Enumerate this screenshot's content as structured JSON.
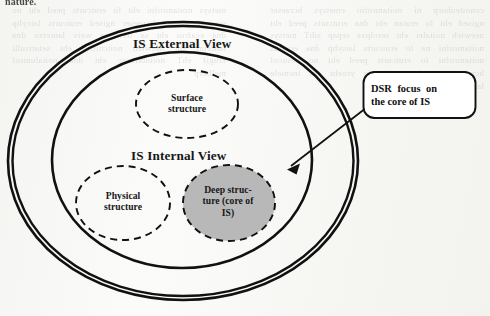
{
  "page": {
    "width": 490,
    "height": 316,
    "background_color": "#f6f6f3",
    "top_text_fragment": "nature."
  },
  "diagram": {
    "type": "nested-ellipse-venn",
    "title_visible": false,
    "outer_region": {
      "name": "IS External View",
      "label": "IS External View",
      "border_style": "double-solid",
      "border_color": "#111111",
      "fill": "none"
    },
    "inner_region": {
      "name": "IS Internal View",
      "label": "IS Internal View",
      "border_style": "solid",
      "border_color": "#111111",
      "fill": "none"
    },
    "nodes": [
      {
        "id": "surface",
        "label": "Surface structure",
        "lines": [
          "Surface",
          "structure"
        ],
        "shape": "ellipse",
        "border_style": "dashed",
        "fill": "none",
        "container": "IS External View"
      },
      {
        "id": "physical",
        "label": "Physical structure",
        "lines": [
          "Physical",
          "structure"
        ],
        "shape": "ellipse",
        "border_style": "dashed",
        "fill": "none",
        "container": "IS Internal View"
      },
      {
        "id": "deep",
        "label": "Deep structure (core of IS)",
        "lines": [
          "Deep struc-",
          "ture (core of",
          "IS)"
        ],
        "shape": "ellipse",
        "border_style": "dashed",
        "fill": "#b8b8b8",
        "container": "IS Internal View"
      }
    ],
    "callout": {
      "lines": [
        "DSR focus on",
        "the core of IS"
      ],
      "line1": "DSR focus on",
      "line2": "the core of IS",
      "shape": "rounded-rectangle",
      "border_color": "#111111",
      "fill": "#ffffff",
      "points_to": "deep"
    },
    "arrow": {
      "from": "callout",
      "to": "deep",
      "style": "solid-line-with-arrowhead",
      "color": "#111111"
    }
  },
  "background_text": {
    "note": "faint mirrored bleed-through text from reverse of scanned page",
    "left_column": "conoiteuborp ni noitamrofni emetsys hcraeser ngised eht fo erutan eht dna erutcurts peed eht neewteb noitaler eht serolpxe repap sihT metsys noitamrofni na fo erutcurts laisyhp dna ecafrus noitamrofni fo erutcurts peed eht no sesucof hcraeser ngised ecneics fo yroeht eht tnemele laitnesse na si hcihw",
    "right_column": "metsys noitamrofni eht fo erutcurts peed eht no sesucof ylniam hcraeser ngised erutcurts laicyhp dna ecafrus eht sa llew sa weiv lanretxe dna lanretni eht neewteb noitcnitsid eht setartsulli erugif ehT noitubirtnoc eht dna noitalumrof melborp"
  }
}
